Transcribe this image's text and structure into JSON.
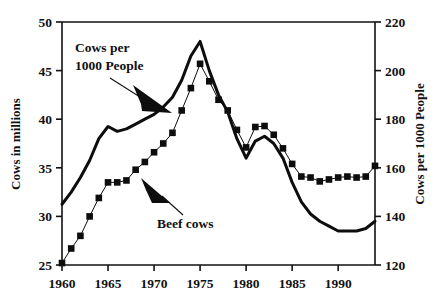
{
  "chart_data": {
    "type": "line",
    "title": "",
    "xlabel": "",
    "ylabel": "Cows in millions",
    "y2label": "Cows per 1000 People",
    "xlim": [
      1960,
      1994
    ],
    "ylim": [
      25,
      50
    ],
    "y2lim": [
      120,
      220
    ],
    "xticks": [
      1960,
      1965,
      1970,
      1975,
      1980,
      1985,
      1990
    ],
    "yticks": [
      25,
      30,
      35,
      40,
      45,
      50
    ],
    "y2ticks": [
      120,
      140,
      160,
      180,
      200,
      220
    ],
    "grid": false,
    "legend_position": "inline-annotations",
    "annotations": [
      {
        "text_line1": "Cows per",
        "text_line2": "1000 People",
        "label": "Cows per 1000 People",
        "target_series": "Cows per 1000 People"
      },
      {
        "text_line1": "Beef cows",
        "text_line2": "",
        "label": "Beef cows",
        "target_series": "Beef cows"
      }
    ],
    "x": [
      1960,
      1961,
      1962,
      1963,
      1964,
      1965,
      1966,
      1967,
      1968,
      1969,
      1970,
      1971,
      1972,
      1973,
      1974,
      1975,
      1976,
      1977,
      1978,
      1979,
      1980,
      1981,
      1982,
      1983,
      1984,
      1985,
      1986,
      1987,
      1988,
      1989,
      1990,
      1991,
      1992,
      1993,
      1994
    ],
    "series": [
      {
        "name": "Beef cows",
        "axis": "left",
        "units": "millions",
        "marker": "filled-square",
        "line_width": 1,
        "values": [
          25.2,
          26.7,
          28.0,
          30.0,
          31.9,
          33.5,
          33.5,
          33.7,
          34.8,
          35.6,
          36.6,
          37.5,
          38.6,
          40.9,
          43.2,
          45.7,
          43.9,
          42.0,
          40.9,
          38.9,
          37.1,
          39.2,
          39.3,
          38.4,
          37.0,
          35.4,
          34.1,
          34.0,
          33.6,
          33.8,
          34.0,
          34.1,
          34.0,
          34.1,
          35.2
        ]
      },
      {
        "name": "Cows per 1000 People",
        "axis": "right",
        "units": "per 1000 people",
        "marker": "none",
        "line_width": 3,
        "values": [
          145,
          150,
          156,
          163,
          172,
          177,
          175,
          176,
          178,
          180,
          182,
          185,
          189,
          196,
          206,
          212,
          200,
          190,
          183,
          172,
          164,
          171,
          173,
          170,
          164,
          154,
          146,
          141,
          138,
          136,
          134,
          134,
          134,
          135,
          138
        ]
      }
    ]
  },
  "axes": {
    "left_title": "Cows in millions",
    "right_title": "Cows per 1000 People"
  }
}
